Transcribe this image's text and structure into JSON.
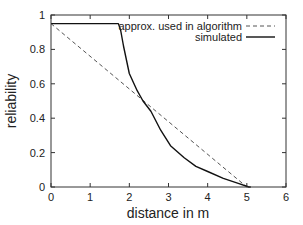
{
  "chart_data": {
    "type": "line",
    "title": "",
    "xlabel": "distance in m",
    "ylabel": "reliability",
    "xlim": [
      0,
      6
    ],
    "ylim": [
      0,
      1
    ],
    "xticks": [
      "0",
      "1",
      "2",
      "3",
      "4",
      "5",
      "6"
    ],
    "yticks": [
      "0",
      "0.2",
      "0.4",
      "0.6",
      "0.8",
      "1"
    ],
    "grid": false,
    "legend_position": "top-right inside",
    "series": [
      {
        "name": "approx. used in algorithm",
        "style": "dashed",
        "color": "#555555",
        "x": [
          0,
          5.0
        ],
        "y": [
          0.95,
          0
        ]
      },
      {
        "name": "simulated",
        "style": "solid",
        "color": "#111111",
        "x": [
          0,
          1.72,
          1.78,
          1.85,
          2.0,
          2.2,
          2.35,
          2.55,
          2.8,
          3.05,
          3.4,
          3.7,
          4.0,
          4.4,
          4.8,
          5.05,
          5.1
        ],
        "y": [
          0.95,
          0.95,
          0.91,
          0.82,
          0.66,
          0.56,
          0.5,
          0.44,
          0.33,
          0.24,
          0.17,
          0.12,
          0.09,
          0.05,
          0.02,
          0.0,
          0.0
        ]
      }
    ]
  }
}
